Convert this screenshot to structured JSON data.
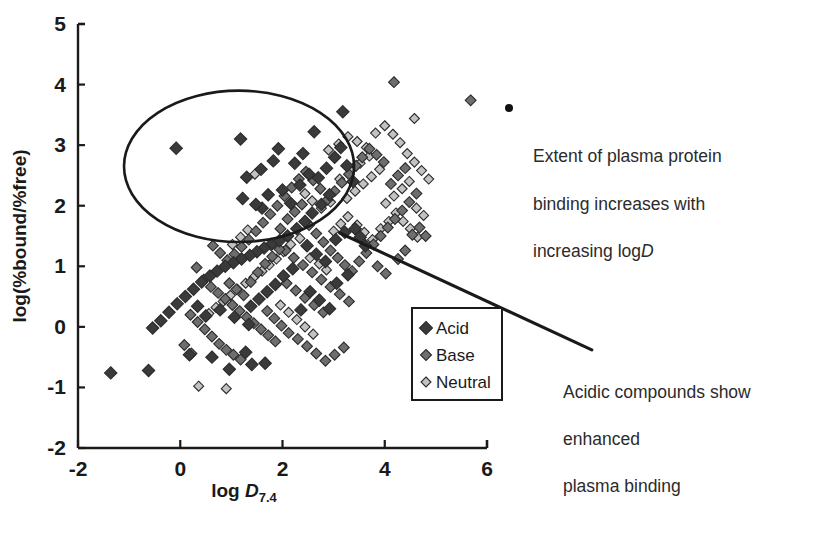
{
  "chart_data": {
    "type": "scatter",
    "title": "",
    "xlabel": "log D7.4",
    "xlabel_main": "log ",
    "xlabel_italic": "D",
    "xlabel_sub": "7.4",
    "ylabel": "log(%bound/%free)",
    "xlim": [
      -2,
      6
    ],
    "ylim": [
      -2,
      5
    ],
    "xticks": [
      -2,
      0,
      2,
      4,
      6
    ],
    "xtick_labels": [
      "-2",
      "0",
      "2",
      "4",
      "6"
    ],
    "yticks": [
      -2,
      -1,
      0,
      1,
      2,
      3,
      4,
      5
    ],
    "ytick_labels": [
      "-2",
      "-1",
      "0",
      "1",
      "2",
      "3",
      "4",
      "5"
    ],
    "grid": false,
    "legend_position": "inside-lower-right",
    "colors": {
      "acid": "#3a3a3a",
      "base": "#6e6e6e",
      "neutral": "#c2c2c2",
      "marker_edge": "#2b2b2b",
      "axis": "#1a1a1a",
      "trend_line": "#1a1a1a",
      "ellipse": "#1a1a1a"
    },
    "series": [
      {
        "name": "Acid",
        "marker": "diamond",
        "color": "#3a3a3a",
        "points": [
          [
            -0.08,
            2.95
          ],
          [
            1.18,
            3.1
          ],
          [
            2.62,
            3.22
          ],
          [
            3.18,
            3.55
          ],
          [
            1.92,
            2.94
          ],
          [
            1.82,
            2.74
          ],
          [
            1.58,
            2.6
          ],
          [
            1.3,
            2.47
          ],
          [
            2.24,
            2.7
          ],
          [
            2.4,
            2.86
          ],
          [
            2.52,
            2.52
          ],
          [
            1.22,
            2.12
          ],
          [
            1.72,
            2.18
          ],
          [
            1.6,
            1.96
          ],
          [
            1.48,
            2.02
          ],
          [
            2.0,
            2.26
          ],
          [
            2.16,
            2.04
          ],
          [
            2.34,
            2.34
          ],
          [
            2.7,
            2.46
          ],
          [
            2.86,
            2.62
          ],
          [
            3.02,
            2.8
          ],
          [
            3.14,
            2.96
          ],
          [
            3.26,
            2.66
          ],
          [
            3.38,
            2.4
          ],
          [
            2.92,
            2.18
          ],
          [
            2.76,
            2.02
          ],
          [
            2.58,
            1.88
          ],
          [
            2.44,
            1.74
          ],
          [
            2.28,
            1.62
          ],
          [
            2.1,
            1.5
          ],
          [
            1.94,
            1.42
          ],
          [
            1.78,
            1.36
          ],
          [
            1.64,
            1.3
          ],
          [
            1.5,
            1.24
          ],
          [
            1.36,
            1.18
          ],
          [
            1.2,
            1.12
          ],
          [
            1.04,
            1.06
          ],
          [
            0.88,
            1.0
          ],
          [
            0.72,
            0.92
          ],
          [
            0.58,
            0.84
          ],
          [
            0.42,
            0.74
          ],
          [
            0.26,
            0.62
          ],
          [
            0.1,
            0.5
          ],
          [
            -0.06,
            0.38
          ],
          [
            -0.22,
            0.24
          ],
          [
            -0.38,
            0.1
          ],
          [
            -0.54,
            -0.02
          ],
          [
            -1.36,
            -0.76
          ],
          [
            -0.62,
            -0.72
          ],
          [
            0.18,
            -0.46
          ],
          [
            0.62,
            -0.5
          ],
          [
            0.96,
            -0.7
          ],
          [
            1.28,
            -0.42
          ],
          [
            1.4,
            -0.62
          ],
          [
            1.66,
            -0.6
          ],
          [
            0.34,
            0.34
          ],
          [
            0.5,
            0.18
          ],
          [
            0.78,
            0.28
          ],
          [
            1.06,
            0.16
          ],
          [
            1.34,
            0.04
          ],
          [
            2.48,
            1.34
          ],
          [
            2.66,
            1.2
          ],
          [
            2.84,
            1.08
          ],
          [
            3.04,
            1.44
          ],
          [
            3.22,
            1.56
          ],
          [
            3.42,
            1.62
          ],
          [
            3.52,
            1.48
          ],
          [
            3.62,
            1.34
          ],
          [
            3.06,
            0.72
          ],
          [
            3.28,
            0.86
          ],
          [
            2.2,
            0.96
          ],
          [
            2.02,
            0.84
          ],
          [
            1.86,
            0.7
          ],
          [
            1.7,
            0.58
          ],
          [
            1.54,
            0.46
          ],
          [
            1.38,
            0.34
          ],
          [
            2.54,
            0.58
          ],
          [
            2.72,
            0.44
          ],
          [
            2.36,
            0.28
          ],
          [
            2.92,
            0.3
          ]
        ]
      },
      {
        "name": "Base",
        "marker": "diamond",
        "color": "#6e6e6e",
        "points": [
          [
            0.32,
            0.98
          ],
          [
            0.46,
            0.78
          ],
          [
            0.6,
            0.66
          ],
          [
            0.74,
            0.56
          ],
          [
            0.88,
            0.46
          ],
          [
            1.02,
            0.36
          ],
          [
            1.16,
            0.26
          ],
          [
            1.3,
            0.16
          ],
          [
            1.44,
            0.06
          ],
          [
            1.58,
            -0.04
          ],
          [
            1.72,
            -0.14
          ],
          [
            1.86,
            -0.24
          ],
          [
            0.2,
            0.2
          ],
          [
            0.34,
            0.08
          ],
          [
            0.48,
            -0.04
          ],
          [
            0.62,
            -0.16
          ],
          [
            0.76,
            -0.28
          ],
          [
            0.9,
            -0.38
          ],
          [
            1.04,
            -0.46
          ],
          [
            1.18,
            -0.54
          ],
          [
            1.96,
            1.62
          ],
          [
            2.1,
            1.78
          ],
          [
            2.24,
            1.9
          ],
          [
            2.38,
            2.02
          ],
          [
            2.52,
            1.68
          ],
          [
            2.66,
            1.54
          ],
          [
            2.8,
            1.4
          ],
          [
            2.94,
            1.26
          ],
          [
            3.08,
            1.14
          ],
          [
            3.22,
            1.02
          ],
          [
            3.36,
            0.92
          ],
          [
            3.5,
            1.08
          ],
          [
            3.64,
            1.22
          ],
          [
            3.78,
            1.36
          ],
          [
            3.92,
            1.5
          ],
          [
            4.06,
            1.64
          ],
          [
            4.2,
            1.78
          ],
          [
            4.34,
            1.92
          ],
          [
            4.48,
            2.06
          ],
          [
            4.62,
            2.2
          ],
          [
            4.12,
            2.36
          ],
          [
            4.26,
            2.5
          ],
          [
            4.4,
            2.62
          ],
          [
            3.98,
            2.72
          ],
          [
            3.84,
            2.84
          ],
          [
            3.7,
            2.94
          ],
          [
            3.56,
            2.8
          ],
          [
            3.44,
            2.66
          ],
          [
            3.3,
            2.52
          ],
          [
            3.16,
            2.38
          ],
          [
            3.02,
            2.24
          ],
          [
            2.88,
            2.1
          ],
          [
            2.74,
            2.28
          ],
          [
            2.6,
            2.42
          ],
          [
            2.46,
            2.56
          ],
          [
            2.32,
            2.44
          ],
          [
            2.18,
            2.3
          ],
          [
            2.04,
            2.16
          ],
          [
            1.9,
            2.0
          ],
          [
            1.76,
            1.86
          ],
          [
            1.62,
            1.72
          ],
          [
            1.48,
            1.58
          ],
          [
            1.34,
            1.44
          ],
          [
            1.2,
            1.32
          ],
          [
            1.06,
            1.2
          ],
          [
            0.92,
            1.1
          ],
          [
            0.78,
            1.22
          ],
          [
            0.64,
            1.34
          ],
          [
            2.06,
            1.26
          ],
          [
            2.22,
            1.14
          ],
          [
            2.4,
            1.02
          ],
          [
            2.58,
            0.9
          ],
          [
            2.76,
            0.78
          ],
          [
            2.94,
            0.66
          ],
          [
            3.12,
            0.54
          ],
          [
            3.3,
            0.42
          ],
          [
            4.54,
            1.52
          ],
          [
            4.68,
            1.64
          ],
          [
            4.8,
            1.5
          ],
          [
            4.26,
            1.12
          ],
          [
            4.4,
            1.26
          ],
          [
            3.86,
            1.0
          ],
          [
            4.02,
            0.88
          ],
          [
            1.52,
            0.9
          ],
          [
            1.66,
            1.04
          ],
          [
            1.8,
            1.16
          ],
          [
            1.94,
            1.28
          ],
          [
            2.08,
            0.72
          ],
          [
            2.26,
            0.6
          ],
          [
            2.44,
            0.48
          ],
          [
            2.62,
            0.36
          ],
          [
            2.8,
            0.24
          ],
          [
            0.96,
            0.72
          ],
          [
            1.1,
            0.62
          ],
          [
            1.24,
            0.52
          ],
          [
            1.38,
            0.74
          ],
          [
            1.7,
            0.26
          ],
          [
            1.84,
            0.14
          ],
          [
            1.98,
            0.02
          ],
          [
            2.12,
            -0.1
          ],
          [
            2.3,
            -0.2
          ],
          [
            2.48,
            -0.32
          ],
          [
            2.66,
            -0.44
          ],
          [
            2.84,
            -0.56
          ],
          [
            3.02,
            -0.46
          ],
          [
            3.2,
            -0.34
          ],
          [
            0.08,
            -0.3
          ],
          [
            0.22,
            -0.44
          ],
          [
            5.68,
            3.74
          ],
          [
            4.18,
            4.04
          ]
        ]
      },
      {
        "name": "Neutral",
        "marker": "diamond",
        "color": "#c2c2c2",
        "points": [
          [
            1.46,
            2.52
          ],
          [
            2.34,
            1.46
          ],
          [
            2.9,
            2.92
          ],
          [
            3.1,
            3.02
          ],
          [
            3.28,
            3.14
          ],
          [
            3.46,
            3.06
          ],
          [
            3.64,
            2.96
          ],
          [
            3.82,
            3.2
          ],
          [
            4.0,
            3.32
          ],
          [
            4.16,
            3.18
          ],
          [
            4.3,
            3.04
          ],
          [
            3.9,
            2.6
          ],
          [
            3.74,
            2.48
          ],
          [
            3.58,
            2.36
          ],
          [
            3.42,
            2.24
          ],
          [
            3.26,
            2.12
          ],
          [
            4.44,
            2.86
          ],
          [
            4.58,
            2.72
          ],
          [
            4.72,
            2.58
          ],
          [
            4.86,
            2.44
          ],
          [
            4.58,
            3.44
          ],
          [
            2.54,
            1.14
          ],
          [
            2.72,
            1.04
          ],
          [
            2.86,
            0.94
          ],
          [
            3.0,
            1.58
          ],
          [
            3.14,
            1.7
          ],
          [
            3.28,
            1.82
          ],
          [
            3.46,
            1.68
          ],
          [
            3.6,
            1.56
          ],
          [
            3.76,
            1.44
          ],
          [
            3.92,
            1.62
          ],
          [
            4.08,
            1.74
          ],
          [
            4.22,
            1.88
          ],
          [
            4.36,
            1.74
          ],
          [
            4.5,
            1.62
          ],
          [
            4.64,
            1.48
          ],
          [
            2.16,
            1.36
          ],
          [
            2.02,
            1.24
          ],
          [
            1.88,
            1.12
          ],
          [
            1.74,
            1.02
          ],
          [
            1.6,
            0.92
          ],
          [
            1.44,
            0.82
          ],
          [
            1.28,
            0.72
          ],
          [
            1.12,
            0.62
          ],
          [
            0.98,
            0.52
          ],
          [
            0.84,
            0.42
          ],
          [
            0.7,
            0.32
          ],
          [
            0.56,
            0.22
          ],
          [
            2.44,
            2.2
          ],
          [
            2.58,
            2.08
          ],
          [
            2.76,
            1.96
          ],
          [
            2.94,
            2.06
          ],
          [
            3.12,
            2.44
          ],
          [
            3.34,
            2.58
          ],
          [
            3.52,
            2.7
          ],
          [
            3.7,
            2.82
          ],
          [
            1.96,
            0.36
          ],
          [
            2.12,
            0.24
          ],
          [
            2.28,
            0.12
          ],
          [
            2.44,
            0.0
          ],
          [
            2.6,
            -0.12
          ],
          [
            0.36,
            -0.98
          ],
          [
            0.9,
            -1.02
          ],
          [
            4.02,
            2.04
          ],
          [
            4.18,
            2.16
          ],
          [
            4.34,
            2.28
          ],
          [
            4.48,
            2.4
          ],
          [
            4.62,
            1.96
          ],
          [
            4.76,
            1.84
          ],
          [
            1.18,
            1.48
          ],
          [
            1.32,
            1.6
          ],
          [
            1.02,
            1.36
          ]
        ]
      }
    ],
    "annotations": [
      {
        "id": "binding",
        "text": "Extent of plasma protein binding increases with increasing logD",
        "lines": [
          "Extent of plasma protein",
          "binding increases with",
          "increasing log"
        ],
        "italic_tail": "D",
        "bullet": true
      },
      {
        "id": "acidic",
        "text": "Acidic compounds show enhanced plasma binding",
        "lines": [
          "Acidic compounds show",
          "enhanced",
          "plasma binding"
        ],
        "bullet": false
      }
    ],
    "shapes": [
      {
        "type": "ellipse",
        "name": "acid-cluster-highlight",
        "cx": 1.15,
        "cy": 2.65,
        "rx": 2.25,
        "ry": 1.25
      },
      {
        "type": "line",
        "name": "pointer-line",
        "x1": 3.12,
        "y1": 1.55,
        "x2": 8.05,
        "y2": -0.38
      }
    ]
  },
  "legend": {
    "items": [
      {
        "label": "Acid",
        "color": "#3a3a3a",
        "size": 13
      },
      {
        "label": "Base",
        "color": "#6e6e6e",
        "size": 11
      },
      {
        "label": "Neutral",
        "color": "#c2c2c2",
        "size": 10
      }
    ]
  }
}
